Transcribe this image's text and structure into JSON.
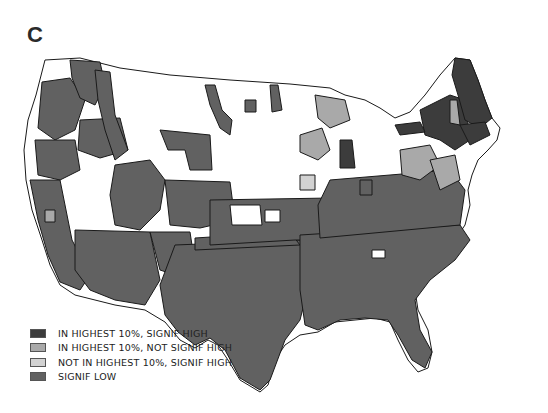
{
  "panel_label": "C",
  "colors": {
    "highest_signif_high": "#3c3c3c",
    "highest_not_signif_high": "#a9a9a9",
    "not_highest_signif_high": "#d2d2d2",
    "signif_low": "#616161",
    "no_data": "#ffffff",
    "border": "#1a1a1a"
  },
  "legend": {
    "items": [
      {
        "label": "IN HIGHEST 10%, SIGNIF HIGH",
        "category": "highest_signif_high"
      },
      {
        "label": "IN HIGHEST 10%, NOT SIGNIF HIGH",
        "category": "highest_not_signif_high"
      },
      {
        "label": "NOT IN HIGHEST 10%, SIGNIF HIGH",
        "category": "not_highest_signif_high"
      },
      {
        "label": "SIGNIF LOW",
        "category": "signif_low"
      }
    ]
  },
  "map": {
    "region": "Contiguous United States",
    "description": "Grayscale choropleth by sub-state region"
  }
}
